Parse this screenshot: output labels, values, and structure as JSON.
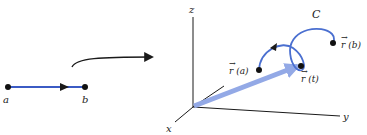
{
  "figure": {
    "interval": {
      "start_label": "a",
      "end_label": "b"
    },
    "mapping_arrow": "curved-arrow",
    "axes": {
      "x_label": "x",
      "y_label": "y",
      "z_label": "z"
    },
    "curve": {
      "name_label": "C",
      "start_label": "r (a)",
      "end_label": "r (b)",
      "point_label": "r (t)",
      "vector_arrow_glyph": "→"
    },
    "colors": {
      "curve": "#4a6fd0",
      "position_vector": "#93a9e6",
      "interval_line": "#3b5bc4",
      "ink": "#1a1a1a"
    }
  }
}
